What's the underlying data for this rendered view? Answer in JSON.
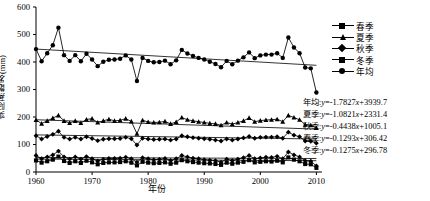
{
  "chart_data": {
    "type": "line",
    "title": "",
    "xlabel": "年份",
    "ylabel": "实际蒸散发(mm)",
    "xlim": [
      1960,
      2011
    ],
    "ylim": [
      0,
      600
    ],
    "ytick_step": 100,
    "grid": false,
    "legend_position": "top-right",
    "xticks": [
      "1960",
      "1970",
      "1980",
      "1990",
      "2000",
      "2010"
    ],
    "xtick_values": [
      1960,
      1970,
      1980,
      1990,
      2000,
      2010
    ],
    "yticks": [
      "0",
      "100",
      "200",
      "300",
      "400",
      "500",
      "600"
    ],
    "ytick_values": [
      0,
      100,
      200,
      300,
      400,
      500,
      600
    ],
    "x": [
      1960,
      1961,
      1962,
      1963,
      1964,
      1965,
      1966,
      1967,
      1968,
      1969,
      1970,
      1971,
      1972,
      1973,
      1974,
      1975,
      1976,
      1977,
      1978,
      1979,
      1980,
      1981,
      1982,
      1983,
      1984,
      1985,
      1986,
      1987,
      1988,
      1989,
      1990,
      1991,
      1992,
      1993,
      1994,
      1995,
      1996,
      1997,
      1998,
      1999,
      2000,
      2001,
      2002,
      2003,
      2004,
      2005,
      2006,
      2007,
      2008,
      2009,
      2010
    ],
    "series": [
      {
        "name": "年均",
        "marker": "circle",
        "trend_label": "年均",
        "equation": "y=-1.7827x+3939.7",
        "slope": -1.7827,
        "intercept": 3939.7,
        "values": [
          447,
          403,
          432,
          461,
          525,
          425,
          404,
          425,
          403,
          430,
          409,
          385,
          401,
          408,
          409,
          412,
          424,
          409,
          331,
          415,
          404,
          399,
          400,
          405,
          392,
          406,
          444,
          431,
          422,
          415,
          409,
          401,
          393,
          381,
          404,
          392,
          405,
          417,
          435,
          414,
          424,
          427,
          427,
          432,
          415,
          489,
          453,
          432,
          380,
          377,
          289
        ]
      },
      {
        "name": "夏季",
        "marker": "triangle",
        "trend_label": "夏季",
        "equation": "y=-1.0821x+2331.4",
        "slope": -1.0821,
        "intercept": 2331.4,
        "values": [
          189,
          176,
          186,
          196,
          206,
          186,
          178,
          186,
          178,
          191,
          194,
          180,
          186,
          192,
          186,
          188,
          194,
          184,
          139,
          188,
          182,
          180,
          181,
          184,
          175,
          182,
          198,
          190,
          186,
          183,
          180,
          177,
          175,
          170,
          180,
          174,
          180,
          186,
          197,
          183,
          187,
          189,
          190,
          192,
          183,
          206,
          198,
          190,
          172,
          170,
          160
        ]
      },
      {
        "name": "秋季",
        "marker": "diamond",
        "trend_label": "秋季",
        "equation": "y=-0.4438x+1005.1",
        "slope": -0.4438,
        "intercept": 1005.1,
        "values": [
          132,
          120,
          129,
          137,
          148,
          126,
          120,
          126,
          120,
          128,
          122,
          114,
          119,
          121,
          121,
          122,
          126,
          121,
          98,
          123,
          120,
          118,
          119,
          120,
          116,
          120,
          132,
          128,
          125,
          123,
          121,
          119,
          116,
          113,
          120,
          116,
          120,
          124,
          129,
          123,
          126,
          127,
          127,
          128,
          123,
          145,
          134,
          128,
          113,
          112,
          105
        ]
      },
      {
        "name": "春季",
        "marker": "cross",
        "trend_label": "春季",
        "equation": "y=-0.1293x+306.42",
        "slope": -0.1293,
        "intercept": 306.42,
        "values": [
          60,
          48,
          55,
          62,
          76,
          55,
          47,
          55,
          47,
          56,
          48,
          40,
          46,
          49,
          49,
          50,
          54,
          48,
          36,
          52,
          48,
          45,
          46,
          49,
          42,
          48,
          60,
          55,
          50,
          48,
          45,
          43,
          41,
          36,
          47,
          42,
          47,
          52,
          60,
          48,
          51,
          54,
          53,
          57,
          48,
          73,
          62,
          55,
          41,
          39,
          22
        ]
      },
      {
        "name": "冬季",
        "marker": "square",
        "trend_label": "冬季",
        "equation": "y=-0.1275x+296.78",
        "slope": -0.1275,
        "intercept": 296.78,
        "values": [
          42,
          34,
          39,
          45,
          56,
          40,
          33,
          39,
          33,
          41,
          35,
          28,
          33,
          35,
          35,
          36,
          39,
          34,
          24,
          37,
          34,
          32,
          33,
          35,
          30,
          34,
          43,
          39,
          36,
          34,
          32,
          31,
          29,
          26,
          34,
          30,
          34,
          37,
          43,
          35,
          37,
          39,
          38,
          41,
          35,
          53,
          45,
          39,
          29,
          28,
          15
        ]
      }
    ],
    "trendlines": [
      {
        "name": "年均",
        "y_start": 447,
        "y_end": 388
      },
      {
        "name": "夏季",
        "y_start": 190,
        "y_end": 156
      },
      {
        "name": "秋季",
        "y_start": 135,
        "y_end": 120
      },
      {
        "name": "春季",
        "y_start": 53,
        "y_end": 49
      },
      {
        "name": "冬季",
        "y_start": 47,
        "y_end": 41
      }
    ],
    "legend": [
      {
        "label": "春季",
        "marker": "square"
      },
      {
        "label": "夏季",
        "marker": "triangle"
      },
      {
        "label": "秋季",
        "marker": "cross"
      },
      {
        "label": "冬季",
        "marker": "square"
      },
      {
        "label": "年均",
        "marker": "circle"
      }
    ],
    "annotations": [
      {
        "prefix": "年均",
        "sep": ":",
        "lhs": "y",
        "eq": "=-1.7827",
        "xv": "x",
        "rhs": "+3939.7"
      },
      {
        "prefix": "夏季",
        "sep": ":",
        "lhs": "y",
        "eq": "=-1.0821",
        "xv": "x",
        "rhs": "+2331.4"
      },
      {
        "prefix": "秋季",
        "sep": ":",
        "lhs": "y",
        "eq": "=-0.4438",
        "xv": "x",
        "rhs": "+1005.1"
      },
      {
        "prefix": "春季",
        "sep": ":",
        "lhs": "y",
        "eq": "=-0.1293",
        "xv": "x",
        "rhs": "+306.42"
      },
      {
        "prefix": "冬季",
        "sep": ":",
        "lhs": "y",
        "eq": "=-0.1275",
        "xv": "x",
        "rhs": "+296.78"
      }
    ]
  }
}
